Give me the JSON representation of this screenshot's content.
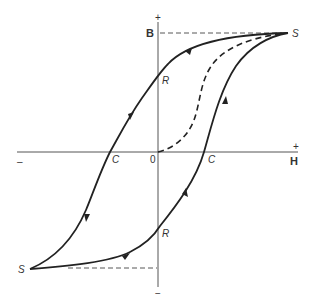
{
  "diagram": {
    "axes": {
      "vertical_label": "B",
      "horizontal_label": "H",
      "vertical_plus": "+",
      "vertical_minus": "−",
      "horizontal_plus": "+",
      "horizontal_minus": "–",
      "origin": "0"
    },
    "points": {
      "saturation_top": "S",
      "saturation_bottom": "S",
      "remanence_top": "R",
      "remanence_bottom": "R",
      "coercivity_left": "C",
      "coercivity_right": "C"
    },
    "curves": [
      {
        "name": "descending branch",
        "from": "S (top)",
        "through": [
          "R (top)",
          "C (left)"
        ],
        "to": "S (bottom)",
        "style": "solid",
        "arrows": 3
      },
      {
        "name": "ascending branch",
        "from": "S (bottom)",
        "through": [
          "R (bottom)",
          "C (right)"
        ],
        "to": "S (top)",
        "style": "solid",
        "arrows": 3
      },
      {
        "name": "initial magnetization curve",
        "from": "0",
        "to": "S (top)",
        "style": "dashed"
      }
    ],
    "colors": {
      "curve": "#222222",
      "axis": "#555555",
      "background": "#ffffff"
    }
  }
}
